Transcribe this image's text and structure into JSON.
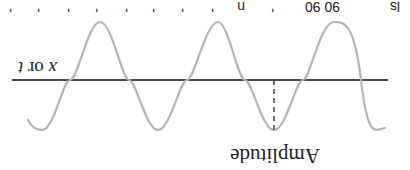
{
  "figure": {
    "orientation": "rotated-180",
    "labels": {
      "amplitude": "Amplitude",
      "axis_var1": "x",
      "axis_sep": " or ",
      "axis_var2": "t"
    },
    "top_fragments": [
      "'",
      "'",
      "'",
      "'",
      "'",
      "'",
      "'",
      "'",
      "n",
      "'",
      "90 90",
      "ls"
    ]
  },
  "colors": {
    "background": "#ffffff",
    "axis": "#4a4a4a",
    "wave": "#b4b4b4",
    "dashed": "#333333",
    "text": "#1e1e1e"
  }
}
